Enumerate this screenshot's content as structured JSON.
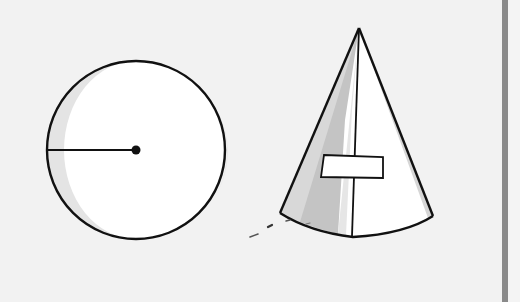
{
  "figure": {
    "colors": {
      "background": "#f2f2f2",
      "fill": "#ffffff",
      "stroke": "#111111",
      "shade_light": "#e2e2e2",
      "shade_dark": "#bdbdbd",
      "frame_bar": "#8a8a8a"
    },
    "circle": {
      "label": "circle",
      "center": [
        136,
        150
      ],
      "radius": 89,
      "radius_line": {
        "from": [
          47,
          150
        ],
        "to": [
          136,
          150
        ]
      },
      "center_dot_radius": 4
    },
    "cone": {
      "label": "cone",
      "apex": [
        359,
        28
      ],
      "base_left": [
        280,
        213
      ],
      "base_right": [
        433,
        216
      ],
      "base_bottom": [
        353,
        237
      ],
      "seam": {
        "from": [
          359,
          28
        ],
        "to": [
          352,
          236
        ]
      },
      "tag_rect": {
        "x": 321,
        "y": 155,
        "width": 62,
        "height": 22
      }
    }
  }
}
